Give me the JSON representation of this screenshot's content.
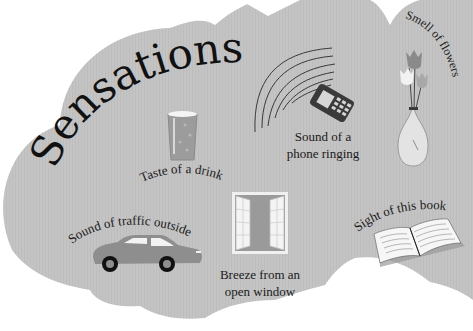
{
  "title": "Sensations",
  "colors": {
    "cloud": "#c3c3c3",
    "background": "#ffffff",
    "text": "#1a1a1a"
  },
  "items": [
    {
      "id": "drink",
      "label": "Taste of a drink",
      "icon": "glass-of-drink-icon"
    },
    {
      "id": "phone",
      "label_line1": "Sound of a",
      "label_line2": "phone ringing",
      "icon": "ringing-phone-icon"
    },
    {
      "id": "flowers",
      "label": "Smell of flowers",
      "icon": "flowers-in-vase-icon"
    },
    {
      "id": "traffic",
      "label": "Sound of traffic outside",
      "icon": "car-icon"
    },
    {
      "id": "window",
      "label_line1": "Breeze from an",
      "label_line2": "open window",
      "icon": "open-window-icon"
    },
    {
      "id": "book",
      "label": "Sight of this book",
      "icon": "open-book-icon"
    }
  ]
}
